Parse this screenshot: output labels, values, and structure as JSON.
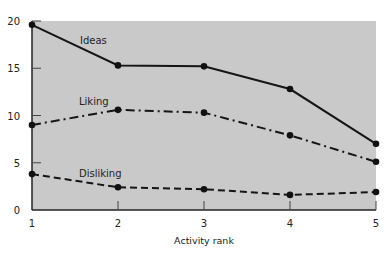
{
  "chart_data": {
    "type": "line",
    "title": "",
    "xlabel": "Activity rank",
    "ylabel": "",
    "x": [
      1,
      2,
      3,
      4,
      5
    ],
    "xticks": [
      "1",
      "2",
      "3",
      "4",
      "5"
    ],
    "yticks": [
      "0",
      "5",
      "10",
      "15",
      "20"
    ],
    "ylim": [
      0,
      20
    ],
    "xlim": [
      1,
      5
    ],
    "grid": false,
    "legend": "inline labels",
    "background": "#c9c9c9",
    "series": [
      {
        "name": "Ideas",
        "style": "solid",
        "values": [
          19.6,
          15.3,
          15.2,
          12.8,
          7.0
        ]
      },
      {
        "name": "Liking",
        "style": "dash-dot",
        "values": [
          9.0,
          10.6,
          10.3,
          7.9,
          5.1
        ]
      },
      {
        "name": "Disliking",
        "style": "dashed",
        "values": [
          3.8,
          2.4,
          2.2,
          1.6,
          1.9
        ]
      }
    ]
  }
}
